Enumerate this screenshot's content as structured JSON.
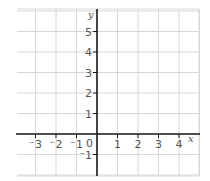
{
  "figure": {
    "type": "coordinate-grid",
    "x_axis_label": "x",
    "y_axis_label": "y",
    "x_range": [
      -4,
      5
    ],
    "y_range": [
      -2,
      6
    ],
    "x_tick_labels": [
      {
        "value": -3,
        "text": "⁻3"
      },
      {
        "value": -2,
        "text": "⁻2"
      },
      {
        "value": -1,
        "text": "⁻1"
      },
      {
        "value": 1,
        "text": "1"
      },
      {
        "value": 2,
        "text": "2"
      },
      {
        "value": 3,
        "text": "3"
      },
      {
        "value": 4,
        "text": "4"
      }
    ],
    "y_tick_labels": [
      {
        "value": 1,
        "text": "1"
      },
      {
        "value": 2,
        "text": "2"
      },
      {
        "value": 3,
        "text": "3"
      },
      {
        "value": 4,
        "text": "4"
      },
      {
        "value": 5,
        "text": "5"
      },
      {
        "value": -1,
        "text": "⁻1"
      }
    ],
    "origin_label": "0",
    "colors": {
      "grid": "#d8d8d8",
      "axes": "#1a1a1a",
      "labels": "#555555"
    }
  }
}
